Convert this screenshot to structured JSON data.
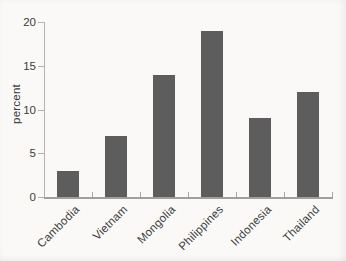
{
  "chart_data": {
    "type": "bar",
    "title": "",
    "xlabel": "",
    "ylabel": "percent",
    "categories": [
      "Cambodia",
      "Vietnam",
      "Mongolia",
      "Philippines",
      "Indonesia",
      "Thailand"
    ],
    "values": [
      3,
      7,
      14,
      19,
      9,
      12
    ],
    "ylim": [
      0,
      20
    ],
    "yticks": [
      0,
      5,
      10,
      15,
      20
    ],
    "grid": false,
    "legend": "none",
    "bar_color": "#5d5d5d",
    "axis_color": "#a8a7a5",
    "text_color": "#3b3b3b",
    "background_color": "#faf9f7"
  }
}
